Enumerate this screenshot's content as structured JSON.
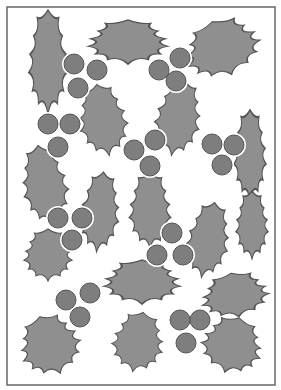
{
  "illustration": {
    "subject": "holly leaves and berries pattern",
    "colors": {
      "leaf": "#8f8f8f",
      "berry": "#7e7e7e",
      "outline": "#555555",
      "background": "#ffffff",
      "frame": "#666666"
    },
    "frame": {
      "x": 7,
      "y": 7,
      "w": 268,
      "h": 378
    },
    "leaves": [
      {
        "cx": 48,
        "cy": 62,
        "rx": 24,
        "ry": 52,
        "rot": 0
      },
      {
        "cx": 128,
        "cy": 42,
        "rx": 50,
        "ry": 22,
        "rot": 0
      },
      {
        "cx": 222,
        "cy": 48,
        "rx": 48,
        "ry": 28,
        "rot": -20
      },
      {
        "cx": 103,
        "cy": 120,
        "rx": 30,
        "ry": 36,
        "rot": -10
      },
      {
        "cx": 178,
        "cy": 118,
        "rx": 28,
        "ry": 38,
        "rot": 10
      },
      {
        "cx": 250,
        "cy": 155,
        "rx": 20,
        "ry": 45,
        "rot": 0
      },
      {
        "cx": 45,
        "cy": 185,
        "rx": 28,
        "ry": 40,
        "rot": -10
      },
      {
        "cx": 100,
        "cy": 212,
        "rx": 24,
        "ry": 40,
        "rot": 5
      },
      {
        "cx": 150,
        "cy": 210,
        "rx": 26,
        "ry": 38,
        "rot": 0
      },
      {
        "cx": 208,
        "cy": 240,
        "rx": 26,
        "ry": 38,
        "rot": 10
      },
      {
        "cx": 252,
        "cy": 225,
        "rx": 20,
        "ry": 34,
        "rot": 0
      },
      {
        "cx": 48,
        "cy": 255,
        "rx": 30,
        "ry": 26,
        "rot": 0
      },
      {
        "cx": 142,
        "cy": 282,
        "rx": 48,
        "ry": 22,
        "rot": 0
      },
      {
        "cx": 235,
        "cy": 295,
        "rx": 42,
        "ry": 22,
        "rot": -10
      },
      {
        "cx": 50,
        "cy": 345,
        "rx": 38,
        "ry": 30,
        "rot": -20
      },
      {
        "cx": 138,
        "cy": 342,
        "rx": 32,
        "ry": 30,
        "rot": 10
      },
      {
        "cx": 232,
        "cy": 345,
        "rx": 38,
        "ry": 28,
        "rot": 15
      }
    ],
    "berries": [
      {
        "cx": 74,
        "cy": 64
      },
      {
        "cx": 97,
        "cy": 70
      },
      {
        "cx": 78,
        "cy": 88
      },
      {
        "cx": 159,
        "cy": 70
      },
      {
        "cx": 180,
        "cy": 58
      },
      {
        "cx": 176,
        "cy": 81
      },
      {
        "cx": 48,
        "cy": 124
      },
      {
        "cx": 70,
        "cy": 124
      },
      {
        "cx": 58,
        "cy": 147
      },
      {
        "cx": 134,
        "cy": 150
      },
      {
        "cx": 155,
        "cy": 140
      },
      {
        "cx": 150,
        "cy": 166
      },
      {
        "cx": 212,
        "cy": 144
      },
      {
        "cx": 234,
        "cy": 145
      },
      {
        "cx": 222,
        "cy": 165
      },
      {
        "cx": 58,
        "cy": 218
      },
      {
        "cx": 82,
        "cy": 218
      },
      {
        "cx": 72,
        "cy": 240
      },
      {
        "cx": 172,
        "cy": 233
      },
      {
        "cx": 157,
        "cy": 255
      },
      {
        "cx": 183,
        "cy": 255
      },
      {
        "cx": 66,
        "cy": 300
      },
      {
        "cx": 90,
        "cy": 293
      },
      {
        "cx": 80,
        "cy": 317
      },
      {
        "cx": 180,
        "cy": 320
      },
      {
        "cx": 200,
        "cy": 320
      },
      {
        "cx": 186,
        "cy": 343
      }
    ]
  }
}
